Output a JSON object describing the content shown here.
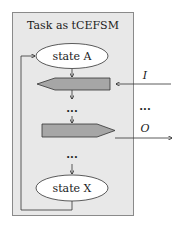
{
  "diagram": {
    "container": {
      "title": "Task as tCEFSM",
      "fill": "#e8e8e8",
      "border": "#8a8a8a"
    },
    "states": [
      {
        "id": "A",
        "label": "state A"
      },
      {
        "id": "X",
        "label": "state X"
      }
    ],
    "blocks": [
      {
        "id": "input-block",
        "direction": "left",
        "fill": "#a6a6a6"
      },
      {
        "id": "output-block",
        "direction": "right",
        "fill": "#a6a6a6"
      }
    ],
    "ellipsis": [
      "...",
      "...",
      "..."
    ],
    "external_signals": {
      "input": {
        "label": "I"
      },
      "output": {
        "label": "O"
      },
      "between": "..."
    }
  }
}
